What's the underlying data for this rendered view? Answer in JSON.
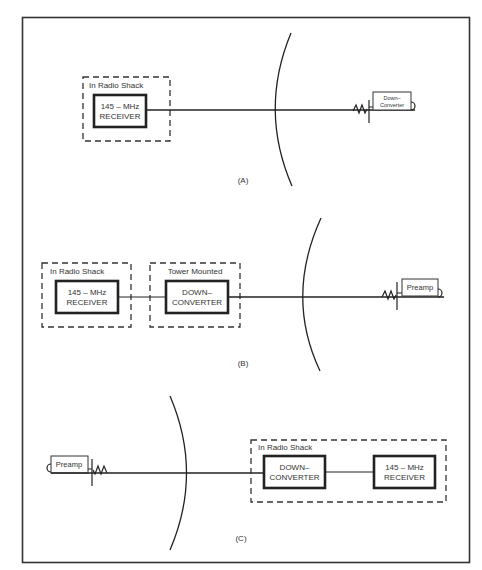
{
  "diagram": {
    "type": "block-diagram",
    "panels": [
      {
        "id": "A",
        "caption": "(A)",
        "groups": [
          {
            "label": "In Radio Shack",
            "blocks": [
              {
                "line1": "145 – MHz",
                "line2": "RECEIVER"
              }
            ]
          }
        ],
        "antenna_device": {
          "line1": "Down–",
          "line2": "Converter"
        }
      },
      {
        "id": "B",
        "caption": "(B)",
        "groups": [
          {
            "label": "In Radio Shack",
            "blocks": [
              {
                "line1": "145 – MHz",
                "line2": "RECEIVER"
              }
            ]
          },
          {
            "label": "Tower Mounted",
            "blocks": [
              {
                "line1": "DOWN–",
                "line2": "CONVERTER"
              }
            ]
          }
        ],
        "antenna_device": {
          "line1": "Preamp"
        }
      },
      {
        "id": "C",
        "caption": "(C)",
        "groups": [
          {
            "label": "In Radio Shack",
            "blocks": [
              {
                "line1": "DOWN–",
                "line2": "CONVERTER"
              },
              {
                "line1": "145 – MHz",
                "line2": "RECEIVER"
              }
            ]
          }
        ],
        "antenna_device": {
          "line1": "Preamp"
        }
      }
    ]
  }
}
